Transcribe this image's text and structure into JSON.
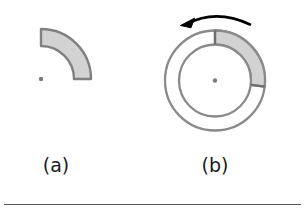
{
  "figure": {
    "caption_labels": {
      "panel_a": "(a)",
      "panel_b": "(b)"
    },
    "colors": {
      "background": "#ffffff",
      "sector_fill": "#d0d0d0",
      "outline": "#808080",
      "outline_dark": "#6e6e6e",
      "arrow": "#000000",
      "center_dot": "#777777",
      "rule": "#55585c",
      "label_text": "#1a1a1a"
    },
    "panel_a": {
      "name": "annular-sector",
      "center": {
        "x": 41,
        "y": 79
      },
      "inner_radius": 33,
      "outer_radius": 50,
      "start_angle_deg": 270,
      "end_angle_deg": 360,
      "sweep_deg": 90,
      "filled": true
    },
    "panel_b": {
      "name": "annulus-with-shaded-sector",
      "center": {
        "x": 215,
        "y": 80.5
      },
      "inner_radius": 36,
      "outer_radius": 50,
      "shaded_sector": {
        "start_angle_deg": 270,
        "end_angle_deg": 7,
        "sweep_deg": 97,
        "filled": true
      },
      "center_dot_radius": 2,
      "rotation_arrow": {
        "direction": "counter-clockwise",
        "arc_radius": 62,
        "tip": {
          "x": 181,
          "y": 25
        },
        "tail": {
          "x": 250,
          "y": 25
        }
      }
    },
    "bottom_rule": {
      "x": 4,
      "y": 204,
      "width": 297,
      "thickness": 1
    }
  }
}
